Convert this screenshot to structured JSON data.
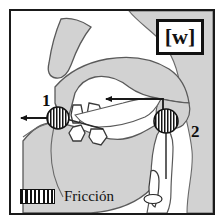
{
  "figure": {
    "title_label": "[w]",
    "border_color": "#1a1a1a",
    "background_color": "#ffffff"
  },
  "phoneme": {
    "symbol": "[w]"
  },
  "markers": [
    {
      "id": "1",
      "label": "1",
      "place": "labial",
      "x": 48,
      "y": 105,
      "radius": 11,
      "fill": "hatched"
    },
    {
      "id": "2",
      "label": "2",
      "place": "velar",
      "x": 163,
      "y": 117,
      "radius": 12,
      "fill": "hatched"
    }
  ],
  "arrows": [
    {
      "name": "lip-outflow-arrow",
      "direction": "left",
      "from_x": 48,
      "from_y": 110,
      "to_x": 12,
      "to_y": 110
    },
    {
      "name": "velar-airflow-arrow",
      "direction": "left",
      "from_x": 163,
      "from_y": 108,
      "to_x": 100,
      "to_y": 96
    }
  ],
  "leader_lines": [
    {
      "name": "velar-leader-line",
      "from_x": 163,
      "from_y": 117,
      "to_x": 163,
      "to_y": 172
    }
  ],
  "legend": {
    "swatch_name": "friction-hatch-swatch",
    "label": "Fricción",
    "pattern": "vertical-stripes",
    "pattern_color": "#111111"
  },
  "colors": {
    "tissue_gray": "#d2d2d2",
    "tissue_gray_dark": "#c9c9c9",
    "outline": "#4a4a4a",
    "outline_dark": "#2a2a2a",
    "cavity_white": "#ffffff",
    "ink": "#111111"
  },
  "anatomy": [
    {
      "name": "nose",
      "fill": "tissue_gray"
    },
    {
      "name": "upper-lip",
      "fill": "tissue_gray"
    },
    {
      "name": "hard-palate",
      "fill": "tissue_gray"
    },
    {
      "name": "soft-palate-velum",
      "fill": "tissue_gray"
    },
    {
      "name": "upper-teeth",
      "fill": "cavity_white"
    },
    {
      "name": "lower-teeth",
      "fill": "cavity_white"
    },
    {
      "name": "tongue",
      "fill": "tissue_gray"
    },
    {
      "name": "lower-jaw-chin",
      "fill": "tissue_gray"
    },
    {
      "name": "pharynx-cavity",
      "fill": "cavity_white"
    },
    {
      "name": "epiglottis",
      "fill": "cavity_white"
    },
    {
      "name": "larynx-vocal-folds",
      "fill": "cavity_white"
    },
    {
      "name": "neck-back",
      "fill": "tissue_gray"
    }
  ]
}
